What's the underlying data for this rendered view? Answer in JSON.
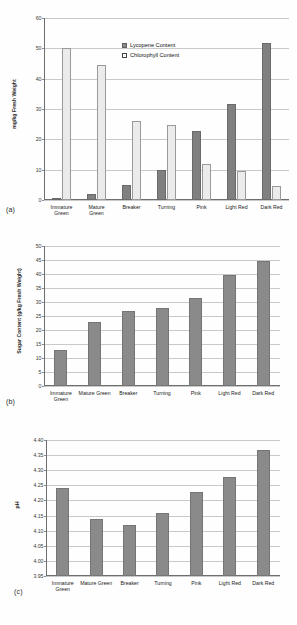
{
  "figure": {
    "background": "#ffffff",
    "colors": {
      "dark_bar": "#808080",
      "light_bar": "#ebebeb",
      "solo_bar": "#8a8a8a",
      "gridline": "#c9c9c9",
      "axis": "#6e6e6e"
    }
  },
  "panels": [
    {
      "id": "a",
      "label": "(a)"
    },
    {
      "id": "b",
      "label": "(b)"
    },
    {
      "id": "c",
      "label": "(c)"
    }
  ],
  "chart_data": [
    {
      "panel": "a",
      "type": "bar",
      "title": "",
      "xlabel": "",
      "ylabel": "mg/kg Fresh Weight",
      "ylim": [
        0,
        60
      ],
      "yticks": [
        0,
        10,
        20,
        30,
        40,
        50,
        60
      ],
      "ytick_labels": [
        "0",
        "10",
        "20",
        "30",
        "40",
        "50",
        "60"
      ],
      "grid": true,
      "legend_position": "upper-center",
      "categories": [
        "Immature Green",
        "Mature Green",
        "Breaker",
        "Turning",
        "Pink",
        "Light Red",
        "Dark Red"
      ],
      "category_lines": [
        [
          "Immature",
          "Green"
        ],
        [
          "Mature",
          "Green"
        ],
        [
          "Breaker",
          ""
        ],
        [
          "Turning",
          ""
        ],
        [
          "Pink",
          ""
        ],
        [
          "Light Red",
          ""
        ],
        [
          "Dark Red",
          ""
        ]
      ],
      "series": [
        {
          "name": "Lycopene Content",
          "values": [
            0.0,
            2.1,
            4.9,
            9.8,
            22.6,
            31.6,
            51.6
          ]
        },
        {
          "name": "Chlorophyll Content",
          "values": [
            50.0,
            44.6,
            25.9,
            24.8,
            11.8,
            9.6,
            4.5
          ]
        }
      ]
    },
    {
      "panel": "b",
      "type": "bar",
      "title": "",
      "xlabel": "",
      "ylabel": "Sugar Content (g/kg Fresh Weight)",
      "ylim": [
        0,
        50
      ],
      "yticks": [
        0,
        5,
        10,
        15,
        20,
        25,
        30,
        35,
        40,
        45,
        50
      ],
      "ytick_labels": [
        "0",
        "5",
        "10",
        "15",
        "20",
        "25",
        "30",
        "35",
        "40",
        "45",
        "50"
      ],
      "grid": true,
      "legend_position": "none",
      "categories": [
        "Immature Green",
        "Mature Green",
        "Breaker",
        "Turning",
        "Pink",
        "Light Red",
        "Dark Red"
      ],
      "category_lines": [
        [
          "Immature",
          "Green"
        ],
        [
          "Mature Green",
          ""
        ],
        [
          "Breaker",
          ""
        ],
        [
          "Turning",
          ""
        ],
        [
          "Pink",
          ""
        ],
        [
          "Light Red",
          ""
        ],
        [
          "Dark Red",
          ""
        ]
      ],
      "series": [
        {
          "name": "Sugar Content",
          "values": [
            12.9,
            22.8,
            26.8,
            27.7,
            31.5,
            39.5,
            44.5
          ]
        }
      ]
    },
    {
      "panel": "c",
      "type": "bar",
      "title": "",
      "xlabel": "",
      "ylabel": "pH",
      "ylim": [
        3.95,
        4.4
      ],
      "yticks": [
        3.95,
        4.0,
        4.05,
        4.1,
        4.15,
        4.2,
        4.25,
        4.3,
        4.35,
        4.4
      ],
      "ytick_labels": [
        "3.95",
        "4.00",
        "4.05",
        "4.10",
        "4.15",
        "4.20",
        "4.25",
        "4.30",
        "4.35",
        "4.40"
      ],
      "grid": true,
      "legend_position": "none",
      "categories": [
        "Immature Green",
        "Mature Green",
        "Breaker",
        "Turning",
        "Pink",
        "Light Red",
        "Dark Red"
      ],
      "category_lines": [
        [
          "Immature",
          "Green"
        ],
        [
          "Mature Green",
          ""
        ],
        [
          "Breaker",
          ""
        ],
        [
          "Turning",
          ""
        ],
        [
          "Pink",
          ""
        ],
        [
          "Light Red",
          ""
        ],
        [
          "Dark Red",
          ""
        ]
      ],
      "series": [
        {
          "name": "pH",
          "values": [
            4.24,
            4.139,
            4.118,
            4.158,
            4.227,
            4.276,
            4.366
          ]
        }
      ]
    }
  ]
}
